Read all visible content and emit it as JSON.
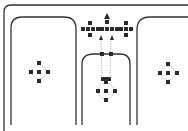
{
  "diagram": {
    "colors": {
      "background": "#ffffff",
      "stroke": "#333333",
      "node": "#2a2a2a",
      "guide": "#888888"
    },
    "icons": [
      "up-arrow-icon",
      "node-cluster-icon"
    ]
  }
}
